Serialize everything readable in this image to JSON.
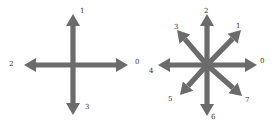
{
  "colors": {
    "arrow": "#6b6b6b",
    "label": "#333333",
    "background": "#ffffff"
  },
  "diagrams": [
    {
      "name": "four-direction",
      "center": [
        73,
        65
      ],
      "arrows": [
        {
          "id": "0",
          "label": "0",
          "tip": [
            128,
            65
          ],
          "label_pos": [
            135,
            59
          ]
        },
        {
          "id": "1",
          "label": "1",
          "tip": [
            73,
            14
          ],
          "label_pos": [
            80,
            8
          ]
        },
        {
          "id": "2",
          "label": "2",
          "tip": [
            24,
            65
          ],
          "label_pos": [
            9,
            61
          ]
        },
        {
          "id": "3",
          "label": "3",
          "tip": [
            73,
            115
          ],
          "label_pos": [
            85,
            104
          ]
        }
      ]
    },
    {
      "name": "eight-direction",
      "center": [
        207,
        65
      ],
      "arrows": [
        {
          "id": "0",
          "label": "0",
          "tip": [
            257,
            65
          ],
          "label_pos": [
            260,
            58
          ]
        },
        {
          "id": "1",
          "label": "1",
          "tip": [
            241,
            30
          ],
          "label_pos": [
            236,
            23
          ]
        },
        {
          "id": "2",
          "label": "2",
          "tip": [
            207,
            14
          ],
          "label_pos": [
            204,
            8
          ]
        },
        {
          "id": "3",
          "label": "3",
          "tip": [
            177,
            30
          ],
          "label_pos": [
            174,
            24
          ]
        },
        {
          "id": "4",
          "label": "4",
          "tip": [
            158,
            65
          ],
          "label_pos": [
            149,
            68
          ]
        },
        {
          "id": "5",
          "label": "5",
          "tip": [
            180,
            95
          ],
          "label_pos": [
            168,
            96
          ]
        },
        {
          "id": "6",
          "label": "6",
          "tip": [
            207,
            116
          ],
          "label_pos": [
            211,
            114
          ]
        },
        {
          "id": "7",
          "label": "7",
          "tip": [
            242,
            96
          ],
          "label_pos": [
            245,
            97
          ]
        }
      ]
    }
  ]
}
